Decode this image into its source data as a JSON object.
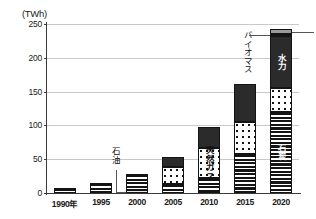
{
  "chart_data": {
    "type": "bar",
    "title": "",
    "subtitle": "",
    "xlabel": "",
    "ylabel": "(TWh)",
    "unit": "TWh",
    "stacked": true,
    "grid": true,
    "legend_position": "none (in-bar labels and callouts)",
    "ylim": [
      0,
      250
    ],
    "yticks": [
      0,
      50,
      100,
      150,
      200,
      250
    ],
    "ytick_labels": [
      "0",
      "50",
      "100",
      "150",
      "200",
      "250"
    ],
    "categories": [
      "1990年",
      "1995",
      "2000",
      "2005",
      "2010",
      "2015",
      "2020"
    ],
    "x": [
      1990,
      1995,
      2000,
      2005,
      2010,
      2015,
      2020
    ],
    "series": [
      {
        "name": "石油",
        "key": "oil",
        "values": [
          0,
          0,
          4,
          0,
          0,
          0,
          0
        ]
      },
      {
        "name": "石炭",
        "key": "coal",
        "values": [
          8,
          15,
          24,
          13,
          22,
          57,
          120
        ]
      },
      {
        "name": "天然ガス",
        "key": "gas",
        "values": [
          0,
          0,
          0,
          25,
          45,
          48,
          35
        ]
      },
      {
        "name": "水力",
        "key": "hydro",
        "values": [
          0,
          0,
          0,
          16,
          30,
          57,
          77
        ]
      },
      {
        "name": "バイオマス",
        "key": "biomass",
        "values": [
          0,
          0,
          0,
          0,
          0,
          0,
          3
        ]
      },
      {
        "name": "風力・太陽光",
        "key": "wind",
        "values": [
          0,
          0,
          0,
          0,
          0,
          0,
          7
        ]
      }
    ],
    "totals": [
      8,
      15,
      28,
      54,
      97,
      162,
      242
    ],
    "annotations": [
      {
        "text": "石油",
        "target": "2000 bottom segment",
        "type": "leader-callout"
      },
      {
        "text": "天然ガス",
        "target": "2010 middle segment",
        "type": "in-bar"
      },
      {
        "text": "水力",
        "target": "2020 upper segment",
        "type": "in-bar"
      },
      {
        "text": "石炭",
        "target": "2020 bottom segment",
        "type": "in-bar"
      },
      {
        "text": "バイオマス",
        "target": "2020 thin band near top",
        "type": "leader-callout"
      },
      {
        "text": "風力・太陽光",
        "target": "2020 top segment",
        "type": "leader-callout"
      }
    ]
  },
  "axis": {
    "unit_label": "(TWh)"
  }
}
